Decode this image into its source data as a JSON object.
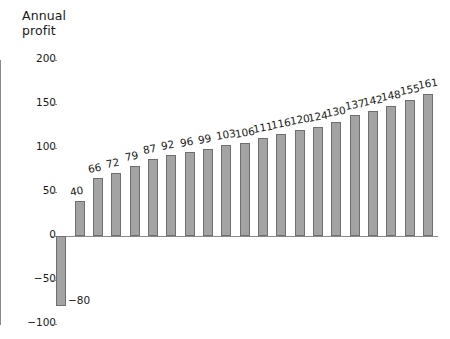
{
  "chart_data": {
    "type": "bar",
    "title": "Annual\nprofit",
    "xlabel": "",
    "ylabel": "Annual profit",
    "ylim": [
      -100,
      200
    ],
    "yticks": [
      200,
      150,
      100,
      50,
      0,
      -50,
      -100
    ],
    "ytick_labels": [
      "200",
      "150",
      "100",
      "50",
      "0",
      "−50",
      "−100"
    ],
    "grid": false,
    "legend": null,
    "categories": [
      "1",
      "2",
      "3",
      "4",
      "5",
      "6",
      "7",
      "8",
      "9",
      "10",
      "11",
      "12",
      "13",
      "14",
      "15",
      "16",
      "17",
      "18",
      "19",
      "20",
      "21"
    ],
    "values": [
      -80,
      40,
      66,
      72,
      79,
      87,
      92,
      96,
      99,
      103,
      106,
      111,
      116,
      120,
      124,
      130,
      137,
      142,
      148,
      155,
      161
    ],
    "data_labels": [
      "−80",
      "40",
      "66",
      "72",
      "79",
      "87",
      "92",
      "96",
      "99",
      "103",
      "106",
      "111",
      "116",
      "120",
      "124",
      "130",
      "137",
      "142",
      "148",
      "155",
      "161"
    ],
    "bar_color": "#a3a3a3",
    "bar_edge_color": "#6f6f6f",
    "axis_color": "#8a8a8a",
    "background": "#ffffff"
  }
}
